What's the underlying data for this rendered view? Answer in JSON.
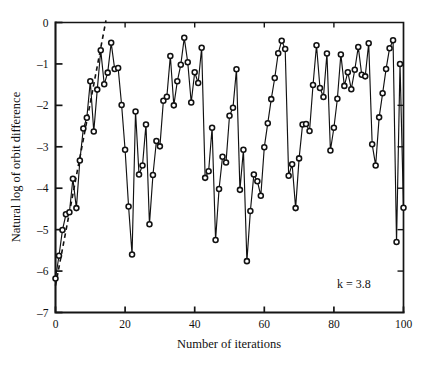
{
  "chart_data": {
    "type": "line",
    "title": "",
    "subtitle": "",
    "xlabel": "Number of iterations",
    "ylabel": "Natural log of orbit difference",
    "xlim": [
      0,
      100
    ],
    "ylim": [
      -7,
      0
    ],
    "xticks": [
      0,
      20,
      40,
      60,
      80,
      100
    ],
    "xticklabels": [
      "0",
      "20",
      "40",
      "60",
      "80",
      "100"
    ],
    "yticks": [
      0,
      -1,
      -2,
      -3,
      -4,
      -5,
      -6,
      -7
    ],
    "yticklabels": [
      "0",
      "–1",
      "–2",
      "–3",
      "–4",
      "–5",
      "–6",
      "–7"
    ],
    "grid": false,
    "legend": null,
    "legend_position": "none",
    "annotations": [
      {
        "text": "k = 3.8",
        "x": 82,
        "y": -6.2
      }
    ],
    "marker": "open-circle",
    "series": [
      {
        "name": "orbit-difference",
        "style": "line-with-open-circle-markers",
        "x": [
          0,
          1,
          2,
          3,
          4,
          5,
          6,
          7,
          8,
          9,
          10,
          11,
          12,
          13,
          14,
          15,
          16,
          17,
          18,
          19,
          20,
          21,
          22,
          23,
          24,
          25,
          26,
          27,
          28,
          29,
          30,
          31,
          32,
          33,
          34,
          35,
          36,
          37,
          38,
          39,
          40,
          41,
          42,
          43,
          44,
          45,
          46,
          47,
          48,
          49,
          50,
          51,
          52,
          53,
          54,
          55,
          56,
          57,
          58,
          59,
          60,
          61,
          62,
          63,
          64,
          65,
          66,
          67,
          68,
          69,
          70,
          71,
          72,
          73,
          74,
          75,
          76,
          77,
          78,
          79,
          80,
          81,
          82,
          83,
          84,
          85,
          86,
          87,
          88,
          89,
          90,
          91,
          92,
          93,
          94,
          95,
          96,
          97,
          98,
          99,
          100
        ],
        "y": [
          -6.18,
          -5.63,
          -5.01,
          -4.63,
          -4.58,
          -3.77,
          -4.48,
          -3.33,
          -2.56,
          -2.3,
          -1.42,
          -2.63,
          -1.62,
          -0.67,
          -1.49,
          -1.21,
          -0.49,
          -1.12,
          -1.1,
          -1.99,
          -3.07,
          -4.44,
          -5.6,
          -2.15,
          -3.67,
          -3.45,
          -2.46,
          -4.87,
          -3.68,
          -2.86,
          -2.99,
          -1.89,
          -1.79,
          -0.81,
          -2.0,
          -1.42,
          -1.02,
          -0.37,
          -0.96,
          -1.93,
          -1.2,
          -1.46,
          -0.61,
          -3.75,
          -3.59,
          -2.54,
          -5.25,
          -4.02,
          -3.24,
          -3.38,
          -2.25,
          -2.06,
          -1.13,
          -4.04,
          -3.07,
          -5.76,
          -4.55,
          -3.67,
          -3.83,
          -4.18,
          -3.01,
          -2.43,
          -1.85,
          -1.34,
          -0.74,
          -0.44,
          -0.64,
          -3.7,
          -3.42,
          -4.48,
          -3.28,
          -2.46,
          -2.45,
          -2.62,
          -1.51,
          -0.55,
          -1.58,
          -1.8,
          -0.75,
          -3.09,
          -2.54,
          -1.84,
          -0.77,
          -1.53,
          -1.2,
          -1.61,
          -1.14,
          -0.59,
          -1.26,
          -1.3,
          -0.5,
          -2.94,
          -3.45,
          -2.29,
          -1.71,
          -1.12,
          -0.62,
          -0.43,
          -5.3,
          -1.0,
          -4.47
        ]
      }
    ],
    "fit_line": {
      "name": "lyapunov-slope-dashed-fit",
      "style": "dashed",
      "x": [
        0,
        14.5
      ],
      "y": [
        -6.35,
        0.05
      ]
    }
  },
  "axis_titles": {
    "x": "Number of iterations",
    "y": "Natural log of orbit difference"
  },
  "annotation": {
    "k_label": "k = 3.8"
  },
  "colors": {
    "axis": "#151515",
    "line": "#111111",
    "marker_fill": "#ffffff",
    "background": "#ffffff"
  }
}
